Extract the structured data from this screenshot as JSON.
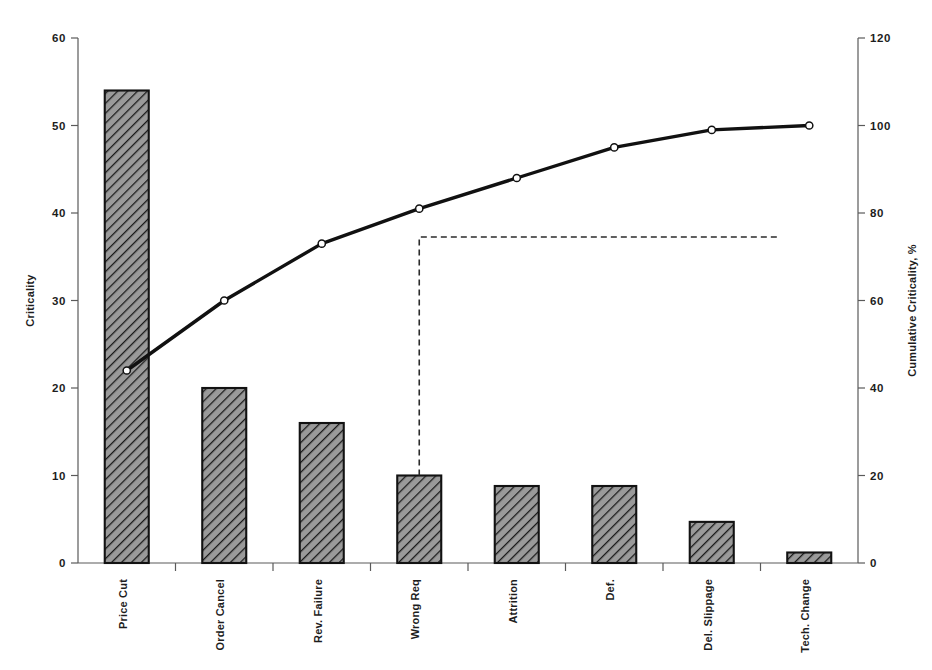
{
  "chart_data": {
    "type": "bar",
    "title": "",
    "subtitle": "",
    "xlabel": "",
    "ylabel": "Criticality",
    "y2label": "Cumulative Criticality, %",
    "ylim": [
      0,
      60
    ],
    "y2lim": [
      0,
      120
    ],
    "grid": false,
    "legend": "none",
    "categories": [
      "Price Cut",
      "Order Cancel",
      "Rev. Failure",
      "Wrong Req",
      "Attrition",
      "Def.",
      "Del. Slippage",
      "Tech. Change"
    ],
    "y_ticks": [
      0,
      10,
      20,
      30,
      40,
      50,
      60
    ],
    "y2_ticks": [
      0,
      20,
      40,
      60,
      80,
      100,
      120
    ],
    "series": [
      {
        "name": "Criticality",
        "type": "bar",
        "axis": "left",
        "values": [
          54,
          20,
          16,
          10,
          8.8,
          8.8,
          4.7,
          1.2
        ]
      },
      {
        "name": "Cumulative Criticality, %",
        "type": "line",
        "axis": "right",
        "values": [
          44,
          60,
          73,
          81,
          88,
          95,
          99,
          100
        ]
      }
    ],
    "annotations": [
      {
        "name": "vital-few-cutoff",
        "style": "dashed",
        "shape": "L-elbow",
        "at_category": "Wrong Req",
        "level_percent": 74.5
      }
    ]
  },
  "axes": {
    "left": {
      "title": "Criticality",
      "ticks": [
        "0",
        "10",
        "20",
        "30",
        "40",
        "50",
        "60"
      ]
    },
    "right": {
      "title": "Cumulative Criticality, %",
      "ticks": [
        "0",
        "20",
        "40",
        "60",
        "80",
        "100",
        "120"
      ]
    },
    "bottom": {
      "labels": [
        "Price Cut",
        "Order Cancel",
        "Rev. Failure",
        "Wrong Req",
        "Attrition",
        "Def.",
        "Del. Slippage",
        "Tech. Change"
      ]
    }
  },
  "colors": {
    "bar_fill": "#8a8a8a",
    "bar_stroke": "#121212",
    "line": "#111111",
    "marker_fill": "#ffffff",
    "axis": "#5a5a5a",
    "text": "#1d1d1d",
    "background": "#ffffff",
    "dashed_guide": "#2b2b2b"
  }
}
